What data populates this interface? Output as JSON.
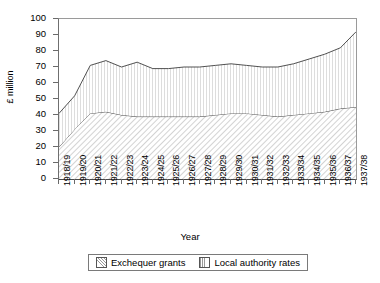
{
  "chart_data": {
    "type": "area",
    "stacked": true,
    "title": "",
    "subtitle": "",
    "xlabel": "Year",
    "ylabel": "£ million",
    "ylim": [
      0,
      100
    ],
    "ytick_step": 10,
    "yticks": [
      "0",
      "10",
      "20",
      "30",
      "40",
      "50",
      "60",
      "70",
      "80",
      "90",
      "100"
    ],
    "grid": false,
    "legend_position": "bottom",
    "categories": [
      "1918/19",
      "1919/20",
      "1920/21",
      "1921/22",
      "1922/23",
      "1923/24",
      "1924/25",
      "1925/26",
      "1926/27",
      "1927/28",
      "1928/29",
      "1929/30",
      "1930/31",
      "1931/32",
      "1932/33",
      "1933/34",
      "1934/35",
      "1935/36",
      "1936/37",
      "1937/38"
    ],
    "series": [
      {
        "name": "Exchequer grants",
        "pattern": "diagonal-hatch",
        "color": "#d8d8d8",
        "values": [
          20,
          31,
          41,
          42,
          40,
          39,
          39,
          39,
          39,
          39,
          40,
          41,
          41,
          40,
          39,
          40,
          41,
          42,
          44,
          45
        ]
      },
      {
        "name": "Local authority rates",
        "pattern": "vertical-hatch",
        "color": "#ededed",
        "values": [
          21,
          21,
          30,
          32,
          30,
          34,
          30,
          30,
          31,
          31,
          31,
          31,
          30,
          30,
          31,
          32,
          34,
          36,
          38,
          47
        ]
      }
    ],
    "totals": [
      41,
      52,
      71,
      74,
      70,
      73,
      69,
      69,
      70,
      70,
      71,
      72,
      71,
      70,
      70,
      72,
      75,
      78,
      82,
      92
    ]
  },
  "legend": {
    "items": [
      {
        "label": "Exchequer grants",
        "swatch": "diagonal-hatch-swatch"
      },
      {
        "label": "Local authority rates",
        "swatch": "vertical-hatch-swatch"
      }
    ]
  },
  "axes": {
    "x_title": "Year",
    "y_title": "£ million"
  }
}
